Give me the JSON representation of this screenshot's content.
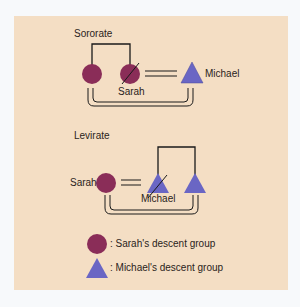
{
  "sororate": {
    "title": "Sororate",
    "sarah_label": "Sarah",
    "michael_label": "Michael"
  },
  "levirate": {
    "title": "Levirate",
    "sarah_label": "Sarah",
    "michael_label": "Michael"
  },
  "legend": {
    "circle_label": ": Sarah's descent group",
    "triangle_label": ": Michael's descent group"
  },
  "colors": {
    "background": "#f4dec4",
    "circle": "#8a2d58",
    "triangle": "#6a66c4"
  }
}
